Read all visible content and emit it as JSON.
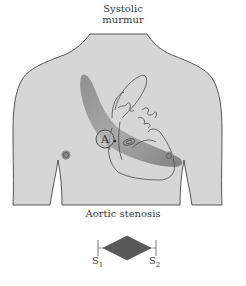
{
  "header": {
    "line1": "Systolic",
    "line2": "murmur"
  },
  "torso": {
    "fill_color": "#d6d6d6",
    "outline_color": "#555555"
  },
  "heart": {
    "outline_color": "#4a4a4a"
  },
  "radiation_band": {
    "color": "#8a8a8a",
    "description": "murmur radiation from aortic area toward neck and apex"
  },
  "auscultation_point": {
    "label": "A",
    "meaning": "aortic area"
  },
  "icons": {
    "nipple_left": "nipple-icon",
    "nipple_right": "nipple-icon"
  },
  "caption": "Aortic stenosis",
  "phonocardiogram": {
    "shape": "crescendo-decrescendo diamond",
    "fill_color": "#555555",
    "s1_label": "S",
    "s1_sub": "1",
    "s2_label": "S",
    "s2_sub": "2"
  }
}
